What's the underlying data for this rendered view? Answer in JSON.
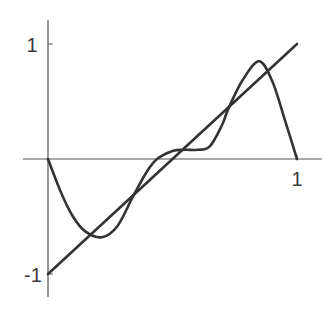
{
  "chart_data": {
    "type": "line",
    "title": "",
    "xlabel": "",
    "ylabel": "",
    "xlim": [
      0,
      1
    ],
    "ylim": [
      -1,
      1
    ],
    "grid": false,
    "legend": null,
    "x_ticks": [
      {
        "value": 1,
        "label": "1"
      }
    ],
    "y_ticks": [
      {
        "value": 1,
        "label": "1"
      },
      {
        "value": -1,
        "label": "-1"
      }
    ],
    "series": [
      {
        "name": "line",
        "description": "straight line y = 2x - 1",
        "x": [
          0,
          1
        ],
        "y": [
          -1,
          1
        ]
      },
      {
        "name": "curve",
        "description": "oscillating polynomial vanishing at 0 and 1, crossing the line several times",
        "x": [
          0,
          0.05,
          0.1,
          0.15,
          0.217,
          0.28,
          0.345,
          0.4,
          0.438,
          0.5,
          0.55,
          0.6,
          0.65,
          0.7,
          0.723,
          0.78,
          0.847,
          0.9,
          0.95,
          1
        ],
        "y": [
          0,
          -0.28,
          -0.5,
          -0.63,
          -0.68,
          -0.58,
          -0.31,
          -0.1,
          0,
          0.07,
          0.08,
          0.08,
          0.11,
          0.3,
          0.43,
          0.68,
          0.85,
          0.68,
          0.35,
          0
        ]
      }
    ],
    "colors": {
      "axis": "#555555",
      "series": "#333333",
      "background": "#ffffff"
    }
  },
  "labels": {
    "y_top": "1",
    "y_bottom": "-1",
    "x_right": "1"
  }
}
